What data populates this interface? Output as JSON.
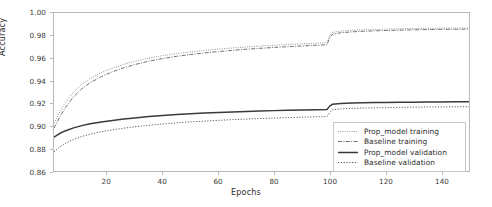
{
  "chart_data": {
    "type": "line",
    "title": "",
    "xlabel": "Epochs",
    "ylabel": "Accuracy",
    "xlim": [
      1,
      150
    ],
    "ylim": [
      0.86,
      1.0
    ],
    "xticks": [
      20,
      40,
      60,
      80,
      100,
      120,
      140
    ],
    "yticks": [
      "1.00",
      "0.98",
      "0.96",
      "0.94",
      "0.92",
      "0.90",
      "0.88",
      "0.86"
    ],
    "ytick_values": [
      1.0,
      0.98,
      0.96,
      0.94,
      0.92,
      0.9,
      0.88,
      0.86
    ],
    "grid": false,
    "legend_position": "lower right",
    "x": [
      1,
      3,
      5,
      8,
      11,
      14,
      18,
      22,
      26,
      30,
      35,
      40,
      45,
      50,
      55,
      60,
      65,
      70,
      75,
      80,
      85,
      90,
      95,
      99,
      100,
      101,
      104,
      108,
      112,
      116,
      120,
      125,
      130,
      135,
      140,
      145,
      150
    ],
    "series": [
      {
        "name": "Prop_model training",
        "style": "dotted-thin",
        "color": "#6e6e6e",
        "values": [
          0.9025,
          0.912,
          0.9205,
          0.93,
          0.937,
          0.942,
          0.9472,
          0.9512,
          0.9545,
          0.9572,
          0.96,
          0.9622,
          0.964,
          0.9655,
          0.9668,
          0.968,
          0.969,
          0.9699,
          0.9707,
          0.9714,
          0.9721,
          0.9727,
          0.9732,
          0.9736,
          0.98,
          0.9828,
          0.984,
          0.9847,
          0.9851,
          0.9854,
          0.9857,
          0.986,
          0.9862,
          0.9864,
          0.9865,
          0.9866,
          0.9867
        ]
      },
      {
        "name": "Baseline training",
        "style": "dashdot",
        "color": "#5f5f5f",
        "values": [
          0.898,
          0.9075,
          0.916,
          0.9258,
          0.933,
          0.9382,
          0.9437,
          0.9479,
          0.9514,
          0.9543,
          0.9573,
          0.9597,
          0.9616,
          0.9632,
          0.9646,
          0.9658,
          0.9669,
          0.9679,
          0.9687,
          0.9695,
          0.9702,
          0.9708,
          0.9714,
          0.9718,
          0.9782,
          0.9812,
          0.9825,
          0.9833,
          0.9838,
          0.9842,
          0.9845,
          0.9848,
          0.9851,
          0.9853,
          0.9855,
          0.9856,
          0.9857
        ]
      },
      {
        "name": "Prop_model validation",
        "style": "solid-thick",
        "color": "#3a3a3a",
        "values": [
          0.89,
          0.8932,
          0.8955,
          0.8982,
          0.9002,
          0.9018,
          0.9035,
          0.9048,
          0.906,
          0.907,
          0.9082,
          0.9092,
          0.91,
          0.9107,
          0.9113,
          0.9118,
          0.9123,
          0.9127,
          0.9131,
          0.9135,
          0.9138,
          0.9141,
          0.9143,
          0.9145,
          0.9175,
          0.9192,
          0.9198,
          0.9202,
          0.9204,
          0.9206,
          0.9207,
          0.9209,
          0.921,
          0.9211,
          0.9212,
          0.9213,
          0.9214
        ]
      },
      {
        "name": "Baseline validation",
        "style": "dotted",
        "color": "#5a5a5a",
        "values": [
          0.877,
          0.8812,
          0.8845,
          0.888,
          0.8906,
          0.8926,
          0.8948,
          0.8965,
          0.8979,
          0.8992,
          0.9005,
          0.9017,
          0.9027,
          0.9035,
          0.9042,
          0.9049,
          0.9055,
          0.906,
          0.9065,
          0.9069,
          0.9073,
          0.9077,
          0.908,
          0.9082,
          0.912,
          0.9142,
          0.915,
          0.9155,
          0.9158,
          0.916,
          0.9162,
          0.9164,
          0.9166,
          0.9167,
          0.9168,
          0.9169,
          0.917
        ]
      }
    ],
    "annotations": [
      {
        "text": "step increase at epoch 100",
        "x": 100
      }
    ]
  },
  "legend": {
    "items": [
      {
        "label": "Prop_model training"
      },
      {
        "label": "Baseline training"
      },
      {
        "label": "Prop_model validation"
      },
      {
        "label": "Baseline validation"
      }
    ]
  },
  "axes": {
    "xlabel": "Epochs",
    "ylabel": "Accuracy"
  }
}
